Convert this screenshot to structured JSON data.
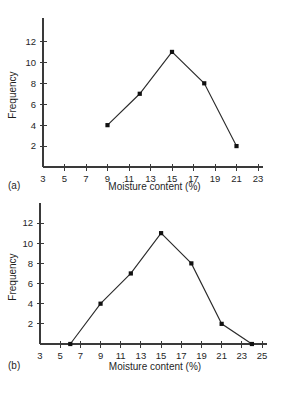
{
  "figure": {
    "background_color": "#ffffff",
    "line_color": "#2b2b2b",
    "axis_color": "#3a3a3a",
    "marker_color": "#111111"
  },
  "panels": [
    {
      "panel_label": "(a)",
      "chart_data": {
        "type": "line",
        "title": "",
        "subtitle": "",
        "xlabel": "Moisture content (%)",
        "ylabel": "Frequency",
        "xlim": [
          3,
          23
        ],
        "ylim": [
          0,
          13
        ],
        "xticks": [
          3,
          5,
          7,
          9,
          11,
          13,
          15,
          17,
          19,
          21,
          23
        ],
        "xtick_labels": [
          "3",
          "5",
          "7",
          "9",
          "11",
          "13",
          "15",
          "17",
          "19",
          "21",
          "23"
        ],
        "yticks": [
          2,
          4,
          6,
          8,
          10,
          12
        ],
        "ytick_labels": [
          "2",
          "4",
          "6",
          "8",
          "10",
          "12"
        ],
        "grid": false,
        "legend": false,
        "markers": "filled-square",
        "x": [
          9,
          12,
          15,
          18,
          21
        ],
        "y": [
          4,
          7,
          11,
          8,
          2
        ],
        "points": [
          {
            "x": 9,
            "y": 4
          },
          {
            "x": 12,
            "y": 7
          },
          {
            "x": 15,
            "y": 11
          },
          {
            "x": 18,
            "y": 8
          },
          {
            "x": 21,
            "y": 2
          }
        ]
      }
    },
    {
      "panel_label": "(b)",
      "chart_data": {
        "type": "line",
        "title": "",
        "subtitle": "",
        "xlabel": "Moisture content (%)",
        "ylabel": "Frequency",
        "xlim": [
          3,
          25
        ],
        "ylim": [
          0,
          13
        ],
        "xticks": [
          3,
          5,
          7,
          9,
          11,
          13,
          15,
          17,
          19,
          21,
          23,
          25
        ],
        "xtick_labels": [
          "3",
          "5",
          "7",
          "9",
          "11",
          "13",
          "15",
          "17",
          "19",
          "21",
          "23",
          "25"
        ],
        "yticks": [
          2,
          4,
          6,
          8,
          10,
          12
        ],
        "ytick_labels": [
          "2",
          "4",
          "6",
          "8",
          "10",
          "12"
        ],
        "grid": false,
        "legend": false,
        "markers": "filled-square",
        "x": [
          6,
          9,
          12,
          15,
          18,
          21,
          24
        ],
        "y": [
          0,
          4,
          7,
          11,
          8,
          2,
          0
        ],
        "points": [
          {
            "x": 6,
            "y": 0
          },
          {
            "x": 9,
            "y": 4
          },
          {
            "x": 12,
            "y": 7
          },
          {
            "x": 15,
            "y": 11
          },
          {
            "x": 18,
            "y": 8
          },
          {
            "x": 21,
            "y": 2
          },
          {
            "x": 24,
            "y": 0
          }
        ]
      }
    }
  ]
}
